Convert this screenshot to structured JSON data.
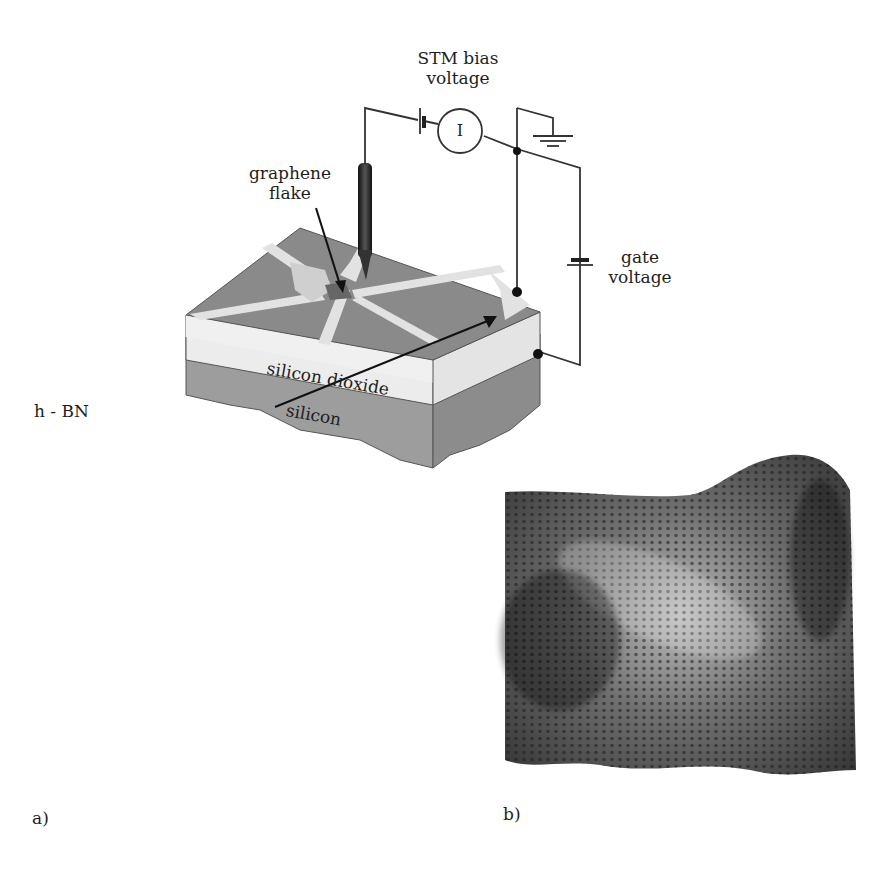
{
  "figure": {
    "panel_a": {
      "label": "a)",
      "labels": {
        "stm_bias": [
          "STM bias",
          "voltage"
        ],
        "current_meter": "I",
        "graphene": [
          "graphene",
          "flake"
        ],
        "gate": [
          "gate",
          "voltage"
        ],
        "oxide": "silicon dioxide",
        "silicon": "silicon",
        "hbn": "h - BN"
      }
    },
    "panel_b": {
      "label": "b)",
      "description": "3D STM topography of graphene honeycomb lattice"
    },
    "colors": {
      "wire": "#333333",
      "top_surface": "#8a8a8a",
      "oxide_layer": "#ececec",
      "silicon_layer": "#9a9a9a",
      "graphene_flake": "#dcdcdc",
      "tip": "#2a2a2a"
    }
  }
}
